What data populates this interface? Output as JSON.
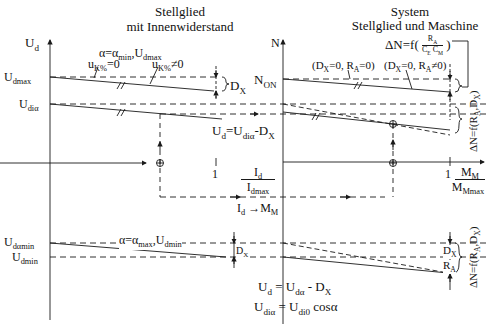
{
  "left_panel": {
    "title_line1": "Stellglied",
    "title_line2": "mit Innenwiderstand",
    "y_axis": {
      "label_main": "U",
      "label_sub": "d"
    },
    "y_ticks": {
      "udmax": {
        "main": "U",
        "sub": "dmax"
      },
      "udialpha": {
        "main": "U",
        "sub": "diα"
      },
      "udalphamin": {
        "main": "U",
        "sub": "dαmin"
      },
      "udmin": {
        "main": "U",
        "sub": "dmin"
      }
    },
    "curve_label_top": {
      "pre": "α=α",
      "sub1": "min",
      "mid": ",U",
      "sub2": "dmax"
    },
    "uk0": {
      "main": "u",
      "sub": "K%",
      "rest": "=0"
    },
    "ukn0": {
      "main": "u",
      "sub": "K%",
      "rest": "≠0"
    },
    "dx_label": {
      "main": "D",
      "sub": "X"
    },
    "dx_label_bottom": {
      "main": "D",
      "sub": "X"
    },
    "formula_ud": {
      "lhs": "U",
      "lhs_sub": "d",
      "eq": "=U",
      "rhs_sub": "diα",
      "rest": "-D",
      "rest_sub": "X"
    },
    "x_axis": {
      "tick_one": "1",
      "num_main": "I",
      "num_sub": "d",
      "den_main": "I",
      "den_sub": "dmax"
    },
    "mapping_label": {
      "a": "I",
      "a_sub": "d",
      "arrow": "→",
      "b": "M",
      "b_sub": "M"
    },
    "curve_label_bottom": {
      "pre": "α=α",
      "sub1": "max",
      "mid": ",U",
      "sub2": "dmin"
    }
  },
  "right_panel": {
    "title_line1": "System",
    "title_line2": "Stellglied und Maschine",
    "delta_formula": {
      "pre": "ΔN=f(",
      "num": "R",
      "num_sub": "A",
      "den1": "C",
      "den1_sub": "E",
      "den2": "C",
      "den2_sub": "M",
      "post": ")"
    },
    "y_axis": {
      "label": "N"
    },
    "y_ticks": {
      "non": {
        "main": "N",
        "sub": "ON"
      }
    },
    "case1": {
      "text": "(D",
      "sub1": "X",
      "mid": "=0, R",
      "sub2": "A",
      "end": "=0)"
    },
    "case2": {
      "text": "(D",
      "sub1": "X",
      "mid": "=0, R",
      "sub2": "A",
      "end": "≠0)"
    },
    "x_axis": {
      "tick_one": "1",
      "num_main": "M",
      "num_sub": "M",
      "den_main": "M",
      "den_sub": "Mmax"
    },
    "delta_side_label": "ΔN=f(R",
    "delta_side_sub": "A",
    "delta_side_mid": ",D",
    "delta_side_sub2": "X",
    "delta_side_end": ")",
    "dx_label": {
      "main": "D",
      "sub": "X"
    },
    "ra_label": {
      "main": "R",
      "sub": "A"
    }
  },
  "equations": {
    "eq1": {
      "a": "U",
      "a_sub": "d",
      "b": " = U",
      "b_sub": "dα",
      "c": " - D",
      "c_sub": "X"
    },
    "eq2": {
      "a": "U",
      "a_sub": "diα",
      "b": " = U",
      "b_sub": "di0",
      "c": "  cosα"
    }
  },
  "colors": {
    "line": "#1a1a1a",
    "background": "#ffffff"
  }
}
